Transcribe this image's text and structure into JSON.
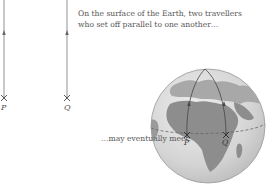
{
  "caption_top": {
    "line1": "On the surface of the Earth, two travellers",
    "line2": "who set off parallel to one another…"
  },
  "caption_bottom": "…may eventually meet:",
  "flat": {
    "point_p": "P",
    "point_q": "Q"
  },
  "globe": {
    "point_p": "P",
    "point_q": "Q"
  },
  "colors": {
    "line": "#777777",
    "globe_ocean": "#d9d9d9",
    "globe_land": "#8a8a8a",
    "globe_outline": "#999999",
    "equator": "#666666"
  }
}
